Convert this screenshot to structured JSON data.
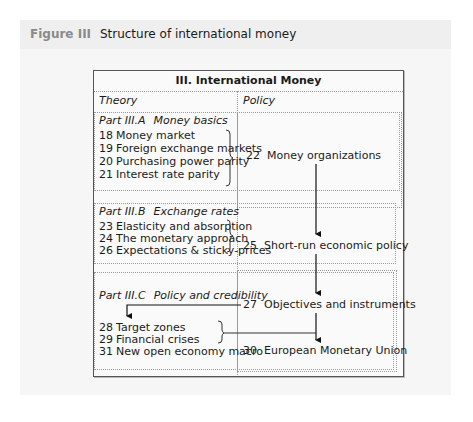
{
  "figure": {
    "label": "Figure III",
    "title": "Structure of international money"
  },
  "diagram": {
    "title": "III. International Money",
    "columns": {
      "theory": "Theory",
      "policy": "Policy"
    },
    "parts": [
      {
        "id": "Part III.A",
        "name": "Money basics",
        "chapters": [
          {
            "num": "18",
            "title": "Money market"
          },
          {
            "num": "19",
            "title": "Foreign exchange markets"
          },
          {
            "num": "20",
            "title": "Purchasing power parity"
          },
          {
            "num": "21",
            "title": "Interest rate parity"
          }
        ]
      },
      {
        "id": "Part III.B",
        "name": "Exchange rates",
        "chapters": [
          {
            "num": "23",
            "title": "Elasticity and absorption"
          },
          {
            "num": "24",
            "title": "The monetary approach"
          },
          {
            "num": "26",
            "title": "Expectations & sticky-prices"
          }
        ]
      },
      {
        "id": "Part III.C",
        "name": "Policy and credibility",
        "chapters": [
          {
            "num": "28",
            "title": "Target zones"
          },
          {
            "num": "29",
            "title": "Financial crises"
          },
          {
            "num": "31",
            "title": "New open economy macro"
          }
        ]
      }
    ],
    "policy": [
      {
        "num": "22",
        "title": "Money organizations"
      },
      {
        "num": "25",
        "title": "Short-run economic policy"
      },
      {
        "num": "27",
        "title": "Objectives and instruments"
      },
      {
        "num": "30",
        "title": "European Monetary Union"
      }
    ],
    "edges": [
      {
        "from": "22",
        "to": "25"
      },
      {
        "from": "25",
        "to": "27"
      },
      {
        "from": "27",
        "to": "28"
      },
      {
        "from": "27",
        "to": "30"
      },
      {
        "from": "28-31",
        "to": "30"
      }
    ]
  }
}
